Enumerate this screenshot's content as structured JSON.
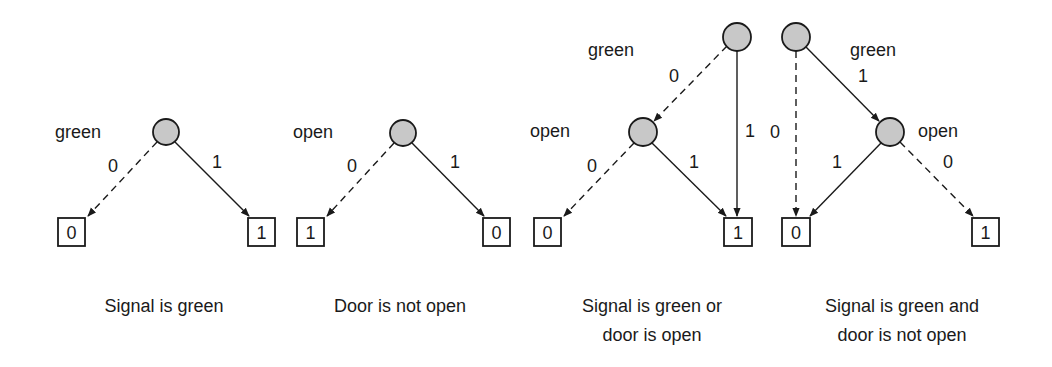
{
  "figure": {
    "colors": {
      "node_fill": "#c8c8c8",
      "stroke": "#1a1a1a",
      "background": "#ffffff"
    },
    "diagrams": [
      {
        "caption": [
          "Signal is green"
        ],
        "nodes": [
          {
            "variable": "green"
          }
        ],
        "edges": [
          {
            "label": "0",
            "style": "dashed"
          },
          {
            "label": "1",
            "style": "solid"
          }
        ],
        "terminals": [
          "0",
          "1"
        ]
      },
      {
        "caption": [
          "Door is not open"
        ],
        "nodes": [
          {
            "variable": "open"
          }
        ],
        "edges": [
          {
            "label": "0",
            "style": "dashed"
          },
          {
            "label": "1",
            "style": "solid"
          }
        ],
        "terminals": [
          "1",
          "0"
        ]
      },
      {
        "caption": [
          "Signal is green or",
          "door is open"
        ],
        "nodes": [
          {
            "variable": "green"
          },
          {
            "variable": "open"
          }
        ],
        "edges": [
          {
            "label": "0",
            "style": "dashed"
          },
          {
            "label": "1",
            "style": "solid"
          },
          {
            "label": "0",
            "style": "dashed"
          },
          {
            "label": "1",
            "style": "solid"
          }
        ],
        "terminals": [
          "0",
          "1"
        ]
      },
      {
        "caption": [
          "Signal is green and",
          "door is not open"
        ],
        "nodes": [
          {
            "variable": "green"
          },
          {
            "variable": "open"
          }
        ],
        "edges": [
          {
            "label": "0",
            "style": "dashed"
          },
          {
            "label": "1",
            "style": "solid"
          },
          {
            "label": "1",
            "style": "solid"
          },
          {
            "label": "0",
            "style": "dashed"
          }
        ],
        "terminals": [
          "0",
          "1"
        ]
      }
    ]
  }
}
